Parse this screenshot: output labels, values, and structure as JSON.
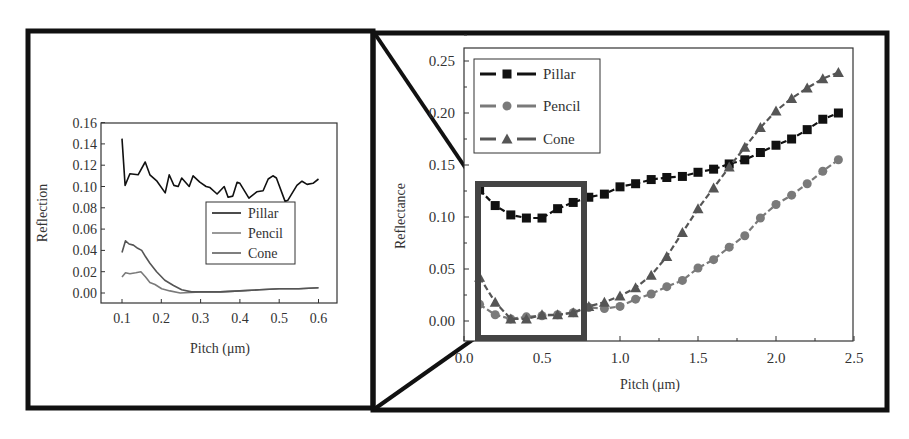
{
  "figure": {
    "left_panel": {
      "ylabel": "Reflection",
      "xlabel": "Pitch (μm)",
      "yticks": [
        "0.00",
        "0.02",
        "0.04",
        "0.06",
        "0.08",
        "0.10",
        "0.12",
        "0.14",
        "0.16"
      ],
      "xticks": [
        "0.1",
        "0.2",
        "0.3",
        "0.4",
        "0.5",
        "0.6"
      ],
      "legend": [
        "Pillar",
        "Pencil",
        "Cone"
      ]
    },
    "right_panel": {
      "ylabel": "Reflectance",
      "xlabel": "Pitch (μm)",
      "yticks": [
        "0.00",
        "0.05",
        "0.10",
        "0.15",
        "0.20",
        "0.25"
      ],
      "xticks": [
        "0.0",
        "0.5",
        "1.0",
        "1.5",
        "2.0",
        "2.5"
      ],
      "legend": [
        "Pillar",
        "Pencil",
        "Cone"
      ]
    },
    "colors": {
      "pillar": "#111111",
      "pencil": "#7a7a7a",
      "cone": "#555555",
      "zoom_box": "#444444",
      "frame": "#111111"
    }
  },
  "chart_data": [
    {
      "type": "line",
      "title": "",
      "xlabel": "Pitch (μm)",
      "ylabel": "Reflection",
      "xlim": [
        0.05,
        0.65
      ],
      "ylim": [
        -0.003,
        0.16
      ],
      "grid": false,
      "legend_position": "center-right",
      "series": [
        {
          "name": "Pillar",
          "x": [
            0.1,
            0.108,
            0.12,
            0.141,
            0.159,
            0.171,
            0.189,
            0.21,
            0.22,
            0.232,
            0.243,
            0.252,
            0.271,
            0.281,
            0.298,
            0.314,
            0.324,
            0.342,
            0.36,
            0.37,
            0.382,
            0.393,
            0.4,
            0.423,
            0.443,
            0.459,
            0.472,
            0.484,
            0.493,
            0.515,
            0.522,
            0.545,
            0.558,
            0.571,
            0.586,
            0.6
          ],
          "y": [
            0.145,
            0.101,
            0.112,
            0.111,
            0.123,
            0.111,
            0.105,
            0.094,
            0.111,
            0.101,
            0.1,
            0.108,
            0.1,
            0.11,
            0.104,
            0.1,
            0.099,
            0.093,
            0.1,
            0.09,
            0.091,
            0.104,
            0.103,
            0.089,
            0.095,
            0.096,
            0.107,
            0.11,
            0.108,
            0.086,
            0.087,
            0.101,
            0.105,
            0.102,
            0.103,
            0.107
          ]
        },
        {
          "name": "Pencil",
          "x": [
            0.1,
            0.109,
            0.12,
            0.135,
            0.148,
            0.16,
            0.171,
            0.184,
            0.201,
            0.222,
            0.248,
            0.3,
            0.35,
            0.4,
            0.45,
            0.5,
            0.55,
            0.6
          ],
          "y": [
            0.015,
            0.019,
            0.018,
            0.019,
            0.02,
            0.015,
            0.01,
            0.008,
            0.004,
            0.002,
            0.0,
            0.001,
            0.001,
            0.002,
            0.003,
            0.004,
            0.004,
            0.005
          ]
        },
        {
          "name": "Cone",
          "x": [
            0.1,
            0.109,
            0.118,
            0.129,
            0.14,
            0.15,
            0.16,
            0.171,
            0.188,
            0.209,
            0.231,
            0.252,
            0.277,
            0.3,
            0.35,
            0.4,
            0.45,
            0.5,
            0.55,
            0.6
          ],
          "y": [
            0.038,
            0.049,
            0.046,
            0.045,
            0.042,
            0.04,
            0.034,
            0.028,
            0.02,
            0.012,
            0.007,
            0.003,
            0.001,
            0.001,
            0.001,
            0.002,
            0.003,
            0.004,
            0.004,
            0.005
          ]
        }
      ]
    },
    {
      "type": "line",
      "title": "",
      "xlabel": "Pitch (μm)",
      "ylabel": "Reflectance",
      "xlim": [
        0.0,
        2.5
      ],
      "ylim": [
        -0.02,
        0.26
      ],
      "grid": false,
      "legend_position": "upper-left",
      "x": [
        0.1,
        0.2,
        0.3,
        0.4,
        0.5,
        0.6,
        0.7,
        0.8,
        0.9,
        1.0,
        1.1,
        1.2,
        1.3,
        1.4,
        1.5,
        1.6,
        1.7,
        1.8,
        1.9,
        2.0,
        2.1,
        2.2,
        2.3,
        2.4
      ],
      "series": [
        {
          "name": "Pillar",
          "marker": "square",
          "values": [
            0.126,
            0.111,
            0.102,
            0.099,
            0.099,
            0.108,
            0.114,
            0.119,
            0.122,
            0.129,
            0.132,
            0.136,
            0.138,
            0.139,
            0.143,
            0.146,
            0.151,
            0.155,
            0.162,
            0.169,
            0.175,
            0.184,
            0.194,
            0.2
          ]
        },
        {
          "name": "Pencil",
          "marker": "circle",
          "values": [
            0.016,
            0.006,
            0.002,
            0.004,
            0.005,
            0.006,
            0.008,
            0.013,
            0.012,
            0.014,
            0.021,
            0.026,
            0.033,
            0.039,
            0.051,
            0.059,
            0.071,
            0.082,
            0.099,
            0.112,
            0.121,
            0.132,
            0.144,
            0.155
          ]
        },
        {
          "name": "Cone",
          "marker": "triangle",
          "values": [
            0.042,
            0.018,
            0.002,
            0.002,
            0.006,
            0.006,
            0.008,
            0.014,
            0.018,
            0.024,
            0.032,
            0.044,
            0.062,
            0.085,
            0.108,
            0.128,
            0.148,
            0.167,
            0.186,
            0.202,
            0.214,
            0.224,
            0.233,
            0.239
          ]
        }
      ],
      "annotations": [
        "Highlight rectangle spanning pitch ≈0.05–0.78 μm, reflectance ≈-0.02–0.135, connected by zoom lines to the left panel"
      ]
    }
  ]
}
